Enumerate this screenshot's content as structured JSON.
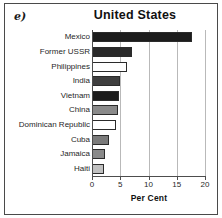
{
  "panel": {
    "letter": "e)"
  },
  "chart_data": {
    "type": "bar",
    "orientation": "horizontal",
    "title": "United States",
    "xlabel": "Per Cent",
    "ylabel": "",
    "xlim": [
      0,
      20
    ],
    "grid": true,
    "legend": false,
    "xticks": [
      "0",
      "5",
      "10",
      "15",
      "20"
    ],
    "xtick_values": [
      0,
      5,
      10,
      15,
      20
    ],
    "categories": [
      "Mexico",
      "Former USSR",
      "Philippines",
      "India",
      "Vietnam",
      "China",
      "Dominican Republic",
      "Cuba",
      "Jamaica",
      "Haiti"
    ],
    "values": [
      17.7,
      7.0,
      6.2,
      5.0,
      4.8,
      4.6,
      4.3,
      3.0,
      2.3,
      2.2
    ],
    "bar_colors": [
      "#1c1c1c",
      "#2a2a2a",
      "#ffffff",
      "#3f3f3f",
      "#1c1c1c",
      "#8a8a8a",
      "#ffffff",
      "#7b7b7b",
      "#8a8a8a",
      "#c0c0c0"
    ]
  },
  "style": {
    "frame_color": "#4a4a4a",
    "grid_color": "#b9b9b9",
    "axis_color": "#4d4d4d",
    "text_color": "#1f1f1f",
    "background": "#ffffff"
  }
}
